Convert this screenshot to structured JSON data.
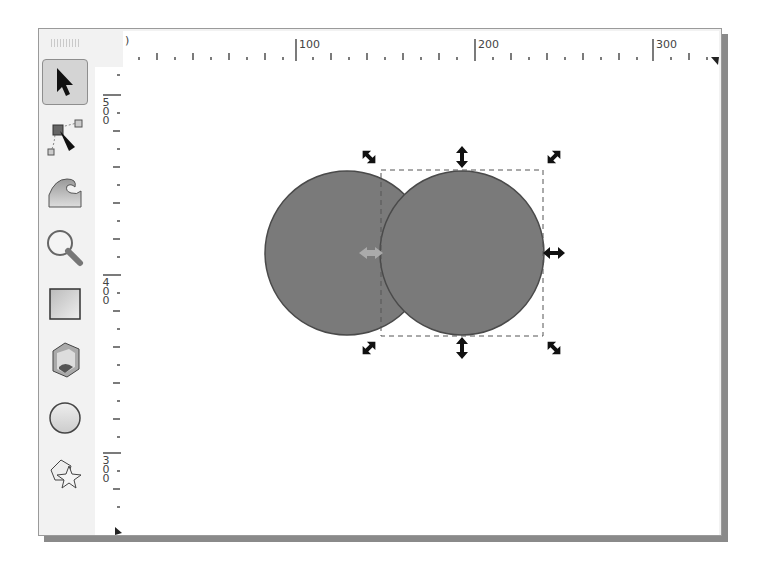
{
  "window": {
    "frame_color": "#9a9a9a",
    "shadow_color": "#8a8a8a"
  },
  "toolbox": {
    "items": [
      {
        "name": "selector-tool",
        "icon": "arrow-pointer-icon",
        "active": true
      },
      {
        "name": "node-tool",
        "icon": "node-edit-icon",
        "active": false
      },
      {
        "name": "tweak-tool",
        "icon": "wave-tweak-icon",
        "active": false
      },
      {
        "name": "zoom-tool",
        "icon": "magnifier-icon",
        "active": false
      },
      {
        "name": "rectangle-tool",
        "icon": "square-icon",
        "active": false
      },
      {
        "name": "3d-box-tool",
        "icon": "cube-icon",
        "active": false
      },
      {
        "name": "ellipse-tool",
        "icon": "circle-icon",
        "active": false
      },
      {
        "name": "star-polygon-tool",
        "icon": "star-polygon-icon",
        "active": false
      }
    ]
  },
  "rulers": {
    "horizontal": {
      "start_label": ")",
      "labels": [
        {
          "text": "100",
          "x": 296
        },
        {
          "text": "200",
          "x": 477
        },
        {
          "text": "300",
          "x": 677
        }
      ]
    },
    "vertical": {
      "labels": [
        {
          "text": "500",
          "chars": [
            "5",
            "0",
            "0"
          ],
          "y": 92
        },
        {
          "text": "400",
          "chars": [
            "4",
            "0",
            "0"
          ],
          "y": 276
        },
        {
          "text": "300",
          "chars": [
            "3",
            "0",
            "0"
          ],
          "y": 455
        }
      ]
    }
  },
  "canvas": {
    "objects": [
      {
        "type": "circle",
        "cx": 346,
        "cy": 252,
        "r": 82,
        "fill": "#7a7a7a",
        "stroke": "#4a4a4a",
        "selected": false
      },
      {
        "type": "circle",
        "cx": 461,
        "cy": 252,
        "r": 82,
        "fill": "#7a7a7a",
        "stroke": "#4a4a4a",
        "selected": true
      }
    ],
    "selection": {
      "bbox": {
        "x": 380,
        "y": 169,
        "w": 162,
        "h": 166
      },
      "handle_color": "#111111",
      "rotation_center_color": "#a8a8a8"
    }
  }
}
